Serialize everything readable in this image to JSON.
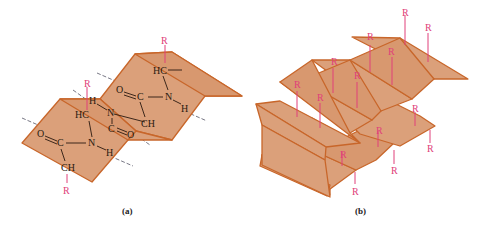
{
  "figure": {
    "panel_a": {
      "caption": "(a)",
      "labels": {
        "r": "R",
        "hc": "HC",
        "ch": "CH",
        "c": "C",
        "n": "N",
        "h": "H",
        "o": "O"
      }
    },
    "panel_b": {
      "caption": "(b)",
      "r": "R"
    },
    "colors": {
      "sheet_fill": "#dba07a",
      "sheet_edge": "#c8662a",
      "side_chain": "#e0407a",
      "atoms": "#2a1a10"
    }
  }
}
